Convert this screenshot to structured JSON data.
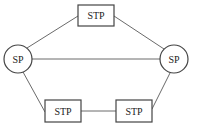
{
  "diagram": {
    "type": "network",
    "nodes": [
      {
        "id": "sp_left",
        "label": "SP",
        "shape": "circle",
        "cx": 18,
        "cy": 59,
        "r": 14
      },
      {
        "id": "sp_right",
        "label": "SP",
        "shape": "circle",
        "cx": 174,
        "cy": 59,
        "r": 14
      },
      {
        "id": "stp_top",
        "label": "STP",
        "shape": "rect",
        "x": 78,
        "y": 5,
        "w": 36,
        "h": 21
      },
      {
        "id": "stp_bottom_left",
        "label": "STP",
        "shape": "rect",
        "x": 45,
        "y": 100,
        "w": 36,
        "h": 22
      },
      {
        "id": "stp_bottom_right",
        "label": "STP",
        "shape": "rect",
        "x": 116,
        "y": 100,
        "w": 36,
        "h": 22
      }
    ],
    "edges": [
      {
        "from": "sp_left",
        "to": "stp_top"
      },
      {
        "from": "stp_top",
        "to": "sp_right"
      },
      {
        "from": "sp_left",
        "to": "sp_right"
      },
      {
        "from": "sp_left",
        "to": "stp_bottom_left"
      },
      {
        "from": "stp_bottom_left",
        "to": "stp_bottom_right"
      },
      {
        "from": "stp_bottom_right",
        "to": "sp_right"
      }
    ]
  }
}
